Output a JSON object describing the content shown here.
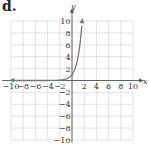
{
  "figure": {
    "label": "d."
  },
  "chart_data": {
    "type": "line",
    "title": "",
    "xlabel": "x",
    "ylabel": "y",
    "xlim": [
      -10,
      10
    ],
    "ylim": [
      -10,
      10
    ],
    "grid": true,
    "x_ticks": [
      -10,
      -8,
      -6,
      -4,
      -2,
      2,
      4,
      6,
      8,
      10
    ],
    "y_ticks": [
      10,
      8,
      6,
      4,
      2,
      -2,
      -4,
      -6,
      -8,
      -10
    ],
    "x_tick_labels": [
      "−10",
      "−8",
      "−6",
      "−4",
      "−2",
      "2",
      "4",
      "6",
      "8",
      "10"
    ],
    "y_tick_labels": [
      "10",
      "8",
      "6",
      "4",
      "2",
      "−2",
      "−4",
      "−6",
      "−8",
      "−10"
    ],
    "series": [
      {
        "name": "exponential curve",
        "x": [
          -10,
          -8,
          -6,
          -4,
          -2,
          -1,
          0,
          0.5,
          1,
          1.25,
          1.5,
          1.66
        ],
        "y": [
          0.0,
          0.0,
          0.0,
          0.0,
          0.06,
          0.25,
          1,
          2,
          4,
          5.66,
          8,
          10
        ],
        "color": "#777777",
        "arrows": "both"
      }
    ]
  }
}
